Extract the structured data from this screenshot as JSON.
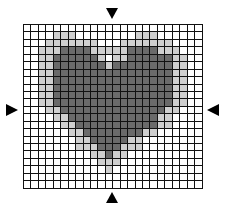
{
  "grid": {
    "cols": 24,
    "rows": 22,
    "cell_size_px": 7.45,
    "colors": {
      "0": "#ffffff",
      "1": "#cfcfcf",
      "2": "#6a6a6a",
      "line": "#111111"
    },
    "legend": {
      "0": "empty",
      "1": "light-gray",
      "2": "dark-gray"
    },
    "cells": [
      "000000000000000000000000",
      "000011100000000111000000",
      "000111111100011111110000",
      "001112222111112222111000",
      "001122222210112222221100",
      "001122222221222222221100",
      "001122222222222222221100",
      "001122222222222222221100",
      "001122222222222222221100",
      "001122222222222222221100",
      "001122222222222222221100",
      "000112222222222222211000",
      "000011222222222222110000",
      "000001122222222222110000",
      "000000112222222211000000",
      "000000011222221100000000",
      "000000011122211100000000",
      "000000000112110000000000",
      "000000000011100000000000",
      "000000000001000000000000",
      "000000000000000000000000",
      "000000000000000000000000"
    ]
  },
  "markers": {
    "top": {
      "direction": "down",
      "icon": "triangle-down-icon"
    },
    "bottom": {
      "direction": "up",
      "icon": "triangle-up-icon"
    },
    "left": {
      "direction": "right",
      "icon": "triangle-right-icon"
    },
    "right": {
      "direction": "left",
      "icon": "triangle-left-icon"
    }
  }
}
